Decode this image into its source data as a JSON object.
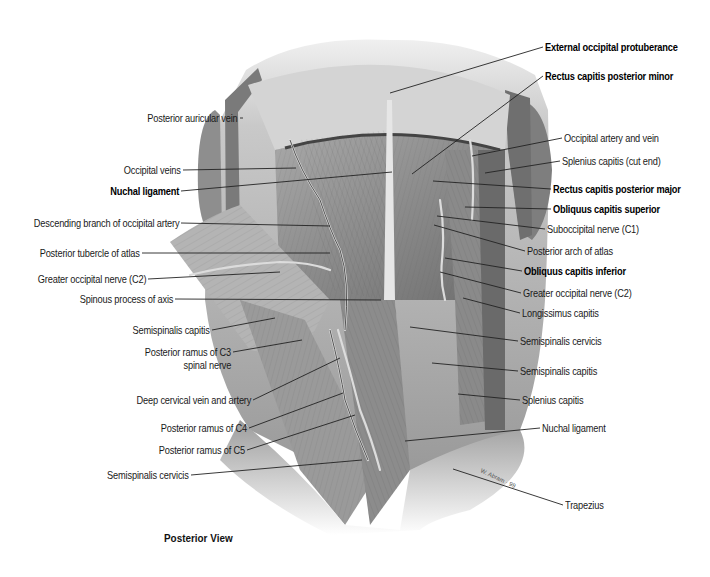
{
  "figure": {
    "view_caption": "Posterior View",
    "colors": {
      "background": "#ffffff",
      "label_text": "#1a1a1a",
      "leader_line": "#222222",
      "illustration_tone": "#8a8a8a"
    }
  },
  "labels_left": [
    {
      "text": "Posterior auricular vein",
      "bold": false,
      "x": 238,
      "y": 118,
      "tx": 243,
      "ty": 118
    },
    {
      "text": "Occipital veins",
      "bold": false,
      "x": 181,
      "y": 170,
      "tx": 296,
      "ty": 168
    },
    {
      "text": "Nuchal ligament",
      "bold": true,
      "x": 179,
      "y": 191,
      "tx": 392,
      "ty": 172
    },
    {
      "text": "Descending branch of occipital artery",
      "bold": false,
      "x": 179,
      "y": 223,
      "tx": 330,
      "ty": 226
    },
    {
      "text": "Posterior tubercle of atlas",
      "bold": false,
      "x": 140,
      "y": 253,
      "tx": 330,
      "ty": 253
    },
    {
      "text": "Greater occipital nerve (C2)",
      "bold": false,
      "x": 146,
      "y": 279,
      "tx": 280,
      "ty": 272
    },
    {
      "text": "Spinous process of axis",
      "bold": false,
      "x": 173,
      "y": 299,
      "tx": 381,
      "ty": 300
    },
    {
      "text": "Semispinalis capitis",
      "bold": false,
      "x": 210,
      "y": 330,
      "tx": 275,
      "ty": 318
    },
    {
      "text": "Posterior ramus of C3",
      "bold": false,
      "x": 231,
      "y": 352,
      "tx": 302,
      "ty": 340
    },
    {
      "text": "spinal nerve",
      "bold": false,
      "x": 231,
      "y": 365,
      "tx": null,
      "ty": null
    },
    {
      "text": "Deep cervical vein and artery",
      "bold": false,
      "x": 251,
      "y": 400,
      "tx": 340,
      "ty": 358
    },
    {
      "text": "Posterior ramus of C4",
      "bold": false,
      "x": 247,
      "y": 428,
      "tx": 343,
      "ty": 393
    },
    {
      "text": "Posterior ramus of C5",
      "bold": false,
      "x": 245,
      "y": 450,
      "tx": 355,
      "ty": 415
    },
    {
      "text": "Semispinalis cervicis",
      "bold": false,
      "x": 189,
      "y": 475,
      "tx": 362,
      "ty": 460
    }
  ],
  "labels_right": [
    {
      "text": "External occipital protuberance",
      "bold": true,
      "x": 545,
      "y": 47,
      "tx": 390,
      "ty": 93
    },
    {
      "text": "Rectus capitis posterior minor",
      "bold": true,
      "x": 545,
      "y": 76,
      "tx": 412,
      "ty": 174
    },
    {
      "text": "Occipital artery and vein",
      "bold": false,
      "x": 564,
      "y": 138,
      "tx": 472,
      "ty": 156
    },
    {
      "text": "Splenius capitis (cut end)",
      "bold": false,
      "x": 562,
      "y": 161,
      "tx": 485,
      "ty": 173
    },
    {
      "text": "Rectus capitis posterior major",
      "bold": true,
      "x": 553,
      "y": 189,
      "tx": 433,
      "ty": 181
    },
    {
      "text": "Obliquus capitis superior",
      "bold": true,
      "x": 553,
      "y": 209,
      "tx": 465,
      "ty": 207
    },
    {
      "text": "Suboccipital nerve (C1)",
      "bold": false,
      "x": 547,
      "y": 229,
      "tx": 437,
      "ty": 216
    },
    {
      "text": "Posterior arch of atlas",
      "bold": false,
      "x": 527,
      "y": 251,
      "tx": 434,
      "ty": 225
    },
    {
      "text": "Obliquus capitis inferior",
      "bold": true,
      "x": 524,
      "y": 271,
      "tx": 445,
      "ty": 258
    },
    {
      "text": "Greater occipital nerve (C2)",
      "bold": false,
      "x": 523,
      "y": 293,
      "tx": 440,
      "ty": 272
    },
    {
      "text": "Longissimus capitis",
      "bold": false,
      "x": 522,
      "y": 313,
      "tx": 463,
      "ty": 298
    },
    {
      "text": "Semispinalis cervicis",
      "bold": false,
      "x": 520,
      "y": 341,
      "tx": 410,
      "ty": 327
    },
    {
      "text": "Semispinalis capitis",
      "bold": false,
      "x": 520,
      "y": 371,
      "tx": 432,
      "ty": 363
    },
    {
      "text": "Splenius capitis",
      "bold": false,
      "x": 522,
      "y": 400,
      "tx": 458,
      "ty": 394
    },
    {
      "text": "Nuchal ligament",
      "bold": false,
      "x": 542,
      "y": 428,
      "tx": 405,
      "ty": 441
    },
    {
      "text": "Trapezius",
      "bold": false,
      "x": 565,
      "y": 505,
      "tx": 453,
      "ty": 469
    }
  ]
}
